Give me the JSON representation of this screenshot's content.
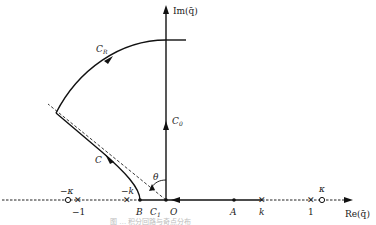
{
  "diagram": {
    "axes": {
      "x_label": "Re(q̄)",
      "y_label": "Im(q̄)",
      "origin_label": "O"
    },
    "contours": [
      {
        "id": "C_R",
        "label": "C",
        "sub": "R",
        "kind": "arc"
      },
      {
        "id": "C0",
        "label": "C",
        "sub": "0",
        "kind": "imag-axis"
      },
      {
        "id": "C1",
        "label": "C",
        "sub": "1",
        "kind": "real-segment"
      },
      {
        "id": "C",
        "label": "C",
        "sub": "",
        "kind": "curve"
      }
    ],
    "angle_label": "θ",
    "points": [
      {
        "label": "−κ",
        "marker": "circle",
        "pos": "above"
      },
      {
        "label": "−1",
        "marker": "cross",
        "pos": "below"
      },
      {
        "label": "−k",
        "marker": "cross",
        "pos": "above"
      },
      {
        "label": "B",
        "marker": "dot",
        "pos": "below"
      },
      {
        "label": "A",
        "marker": "dot",
        "pos": "below"
      },
      {
        "label": "k",
        "marker": "cross",
        "pos": "below"
      },
      {
        "label": "1",
        "marker": "cross",
        "pos": "below"
      },
      {
        "label": "κ",
        "marker": "circle",
        "pos": "above"
      }
    ],
    "caption": "图 … 积分回路与奇点分布"
  }
}
